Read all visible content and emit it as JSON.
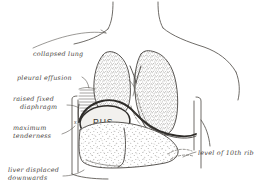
{
  "figure": {
    "background_color": "#ffffff",
    "ink_color": "#46433f",
    "text_color": "#4a4743"
  },
  "annotations": [
    {
      "id": "collapsed-lung",
      "lines": [
        "collapsed lung"
      ],
      "text": "collapsed lung",
      "position": "left-upper",
      "has_leader": true
    },
    {
      "id": "pleural-effusion",
      "lines": [
        "pleural effusion"
      ],
      "text": "pleural effusion",
      "position": "left-middle",
      "has_leader": true
    },
    {
      "id": "raised-fixed-diaphragm",
      "lines": [
        "raised fixed",
        "diaphragm"
      ],
      "text": "raised fixed diaphragm",
      "position": "left-middle-lower",
      "has_leader": true
    },
    {
      "id": "maximum-tenderness",
      "lines": [
        "maximum",
        "tenderness"
      ],
      "text": "maximum tenderness",
      "position": "left-lower",
      "has_leader": true,
      "marker": "x"
    },
    {
      "id": "liver-displaced-downwards",
      "lines": [
        "liver displaced",
        "downwards"
      ],
      "text": "liver displaced downwards",
      "position": "bottom-left",
      "has_leader": true
    },
    {
      "id": "level-of-10th-rib",
      "lines": [
        "level of 10th rib"
      ],
      "text": "level of 10th rib",
      "position": "right-lower",
      "has_leader": true
    }
  ],
  "structures": {
    "pus_label": "PUS",
    "pus_cavity_name": "subphrenic pus collection",
    "left_lung_name": "collapsed lung",
    "right_lung_name": "lung",
    "liver_name": "liver",
    "diaphragm_name": "raised fixed diaphragm",
    "rib_marker_name": "10th rib",
    "tenderness_marker": "x"
  }
}
